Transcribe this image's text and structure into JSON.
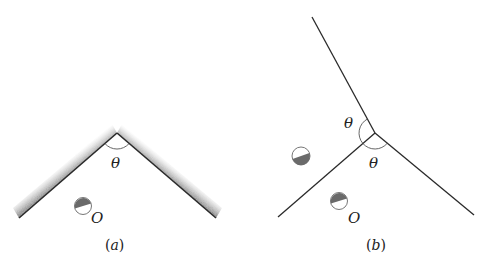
{
  "figure": {
    "panels": [
      {
        "id": "a",
        "caption": "(a)",
        "caption_open": "(",
        "caption_letter": "a",
        "caption_close": ")",
        "angle_label": "θ",
        "point_label": "O",
        "description": "Two plane mirrors meeting at angle θ (reflective side shaded), with a half-shaded ball O between them"
      },
      {
        "id": "b",
        "caption": "(b)",
        "caption_open": "(",
        "caption_letter": "b",
        "caption_close": ")",
        "angle_label_1": "θ",
        "angle_label_2": "θ",
        "point_label": "O",
        "description": "Three rays from a common vertex forming two equal angles θ, with object O and its image ball"
      }
    ],
    "colors": {
      "line": "#2a2a2a",
      "shading": "#9a9a9a",
      "ball_dark": "#6a6a6a",
      "ball_edge": "#777777",
      "arc": "#555555"
    }
  }
}
